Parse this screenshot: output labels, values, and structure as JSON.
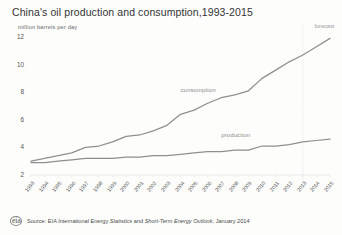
{
  "chart_data": {
    "type": "line",
    "title": "China's oil production and consumption,1993-2015",
    "subtitle": "million barrels per day",
    "xlabel": "",
    "ylabel": "million barrels per day",
    "ylim": [
      2,
      12
    ],
    "yticks": [
      12,
      10,
      8,
      6,
      4,
      2
    ],
    "grid": false,
    "legend_position": "inline-annotation",
    "categories": [
      1993,
      1994,
      1995,
      1996,
      1997,
      1998,
      1999,
      2000,
      2001,
      2002,
      2003,
      2004,
      2005,
      2006,
      2007,
      2008,
      2009,
      2010,
      2011,
      2012,
      2013,
      2014,
      2015
    ],
    "xticks": [
      "1993",
      "1994",
      "1995",
      "1996",
      "1997",
      "1998",
      "1999",
      "2000",
      "2001",
      "2002",
      "2003",
      "2004",
      "2005",
      "2006",
      "2007",
      "2008",
      "2009",
      "2010",
      "2011",
      "2012",
      "2013",
      "2014",
      "2015"
    ],
    "series": [
      {
        "name": "consumption",
        "color": "#8f8f8f",
        "values": [
          3.0,
          3.2,
          3.4,
          3.6,
          4.0,
          4.1,
          4.4,
          4.8,
          4.9,
          5.2,
          5.6,
          6.4,
          6.7,
          7.2,
          7.6,
          7.8,
          8.1,
          9.0,
          9.6,
          10.2,
          10.7,
          11.3,
          11.9
        ]
      },
      {
        "name": "production",
        "color": "#8f8f8f",
        "values": [
          2.9,
          2.9,
          3.0,
          3.1,
          3.2,
          3.2,
          3.2,
          3.3,
          3.3,
          3.4,
          3.4,
          3.5,
          3.6,
          3.7,
          3.7,
          3.8,
          3.8,
          4.1,
          4.1,
          4.2,
          4.4,
          4.5,
          4.6
        ]
      }
    ],
    "annotations": [
      {
        "name": "consumption-label",
        "text": "consumption",
        "x": 2004,
        "y": 8.4
      },
      {
        "name": "production-label",
        "text": "production",
        "x": 2007,
        "y": 5.1
      },
      {
        "name": "forecast-label",
        "text": "forecast",
        "x": 2014,
        "y": 12.2
      }
    ],
    "forecast_divider": {
      "x": 2013,
      "style": "dotted",
      "color": "#d8d8d8"
    }
  },
  "footer": {
    "logo": "eia",
    "source_prefix": "Source:",
    "source_a": "EIA",
    "source_b": "International Energy",
    "source_ital1": "Statistics",
    "source_c": "and",
    "source_ital2": "Short-Term Energy Outlook,",
    "source_date": "January 2014"
  }
}
